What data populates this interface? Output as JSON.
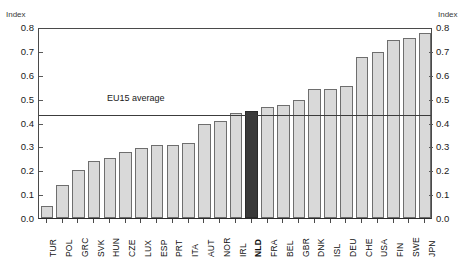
{
  "title_partial": "",
  "axis": {
    "unit_label_left": "Index",
    "unit_label_right": "Index",
    "yticks": [
      "0.8",
      "0.7",
      "0.6",
      "0.5",
      "0.4",
      "0.3",
      "0.2",
      "0.1",
      "0.0"
    ]
  },
  "annotation": {
    "eu15_label": "EU15 average"
  },
  "colors": {
    "bar_fill": "#d9d9d9",
    "bar_stroke": "#6e6e6e",
    "highlight_fill": "#3a3a3a",
    "axis": "#4a4a4a",
    "average_line": "#3c3c3c"
  },
  "chart_data": {
    "type": "bar",
    "title": "",
    "xlabel": "",
    "ylabel": "Index",
    "ylim": [
      0.0,
      0.8
    ],
    "ytick_step": 0.1,
    "grid": false,
    "legend": null,
    "highlight": "NLD",
    "annotations": [
      {
        "label": "EU15 average",
        "type": "hline",
        "value": 0.44
      }
    ],
    "categories": [
      "TUR",
      "POL",
      "GRC",
      "SVK",
      "HUN",
      "CZE",
      "LUX",
      "ESP",
      "PRT",
      "ITA",
      "AUT",
      "NOR",
      "IRL",
      "NLD",
      "FRA",
      "BEL",
      "GBR",
      "DNK",
      "ISL",
      "DEU",
      "CHE",
      "USA",
      "FIN",
      "SWE",
      "JPN"
    ],
    "values": [
      0.05,
      0.14,
      0.2,
      0.24,
      0.25,
      0.275,
      0.295,
      0.305,
      0.305,
      0.315,
      0.395,
      0.405,
      0.44,
      0.45,
      0.465,
      0.475,
      0.495,
      0.54,
      0.54,
      0.555,
      0.675,
      0.695,
      0.745,
      0.755,
      0.775
    ]
  }
}
